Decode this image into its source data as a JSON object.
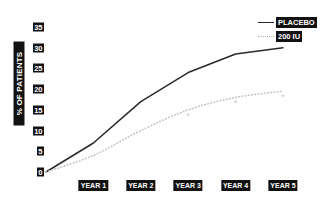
{
  "chart_data": {
    "type": "line",
    "title": "",
    "xlabel": "",
    "ylabel": "% OF PATIENTS",
    "categories": [
      "0",
      "YEAR 1",
      "YEAR 2",
      "YEAR 3",
      "YEAR 4",
      "YEAR 5"
    ],
    "x_tick_labels": [
      "YEAR 1",
      "YEAR 2",
      "YEAR 3",
      "YEAR 4",
      "YEAR 5"
    ],
    "y_tick_labels": [
      "35",
      "30",
      "25",
      "20",
      "15",
      "10",
      "5",
      "0"
    ],
    "y_ticks": [
      35,
      30,
      25,
      20,
      15,
      10,
      5,
      0
    ],
    "ylim": [
      0,
      35
    ],
    "grid": false,
    "legend_position": "top-right",
    "series": [
      {
        "name": "PLACEBO",
        "line_style": "solid",
        "color": "#2a2a2a",
        "x": [
          0,
          1,
          2,
          3,
          4,
          5
        ],
        "values": [
          0,
          7,
          17,
          24,
          28.5,
          30
        ]
      },
      {
        "name": "200 IU",
        "line_style": "dotted",
        "color": "#b9b9b9",
        "x": [
          0,
          1,
          2,
          3,
          4,
          5
        ],
        "values": [
          0,
          4,
          10,
          15,
          18,
          19.5
        ]
      }
    ],
    "annotations": [
      {
        "label": "*",
        "x": 3,
        "y": 12.8
      },
      {
        "label": "*",
        "x": 4,
        "y": 16
      },
      {
        "label": "*",
        "x": 5,
        "y": 17.3
      }
    ]
  },
  "legend": {
    "items": [
      {
        "label": "PLACEBO",
        "style": "solid"
      },
      {
        "label": "200 IU",
        "style": "dotted"
      }
    ]
  },
  "axes": {
    "y_label": "% OF PATIENTS"
  }
}
